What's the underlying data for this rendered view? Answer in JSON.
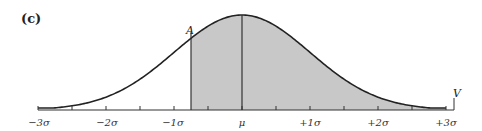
{
  "figure": {
    "panel_label": "(c)",
    "point_label_A": "A",
    "point_label_V": "V",
    "mean_label": "μ",
    "shading_start_sigma": -0.75,
    "colors": {
      "curve": "#222222",
      "shade": "#c8c8c8",
      "axis": "#333333",
      "background": "#ffffff"
    }
  },
  "chart_data": {
    "type": "area",
    "title": "(c)",
    "xlabel": "",
    "ylabel": "",
    "x_ticks": [
      "−3σ",
      "−2σ",
      "−1σ",
      "μ",
      "+1σ",
      "+2σ",
      "+3σ"
    ],
    "x_tick_values": [
      -3,
      -2,
      -1,
      0,
      1,
      2,
      3
    ],
    "minor_ticks_at": [
      -2.5,
      -1.5,
      -0.5,
      0.5,
      1.5,
      2.5
    ],
    "xlim": [
      -3,
      3
    ],
    "grid": false,
    "annotations": [
      {
        "label": "A",
        "x": -0.75,
        "note": "left boundary of shaded region"
      },
      {
        "label": "V",
        "x": 3.0,
        "note": "right end of axis"
      },
      {
        "label": "μ",
        "x": 0,
        "note": "vertical line at mean"
      }
    ],
    "shaded_region": {
      "from": -0.75,
      "to": 3.0
    }
  }
}
